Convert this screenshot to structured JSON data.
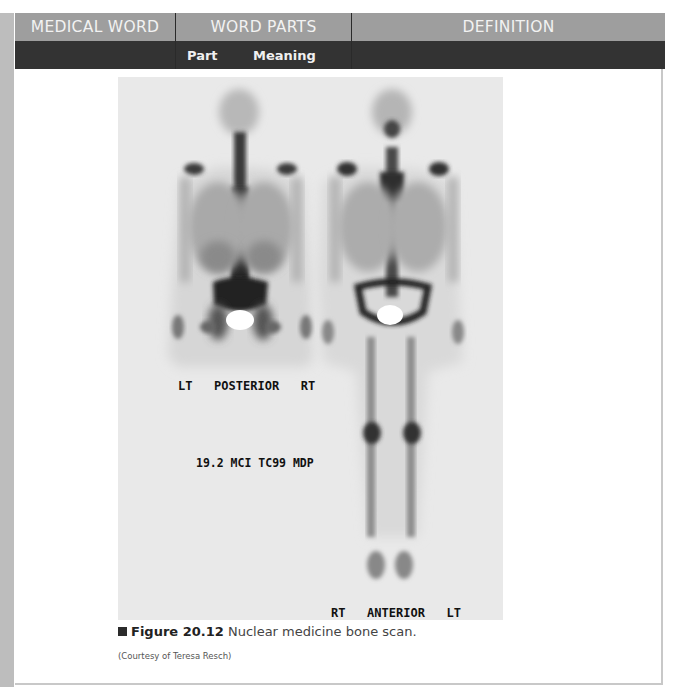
{
  "table_header": {
    "columns": [
      {
        "label": "MEDICAL WORD"
      },
      {
        "label": "WORD PARTS"
      },
      {
        "label": "DEFINITION"
      }
    ],
    "subcolumns": {
      "part": "Part",
      "meaning": "Meaning"
    }
  },
  "figure": {
    "image_labels": {
      "posterior": "LT   POSTERIOR   RT",
      "dose": "19.2 MCI TC99 MDP",
      "anterior": "RT   ANTERIOR   LT"
    },
    "caption_number": "Figure 20.12",
    "caption_text": " Nuclear medicine bone scan.",
    "credit": "(Courtesy of Teresa Resch)"
  },
  "colors": {
    "header_light": "#9e9e9e",
    "header_dark": "#333333",
    "left_bar": "#bdbdbd",
    "scan_background": "#e9e9e9"
  }
}
